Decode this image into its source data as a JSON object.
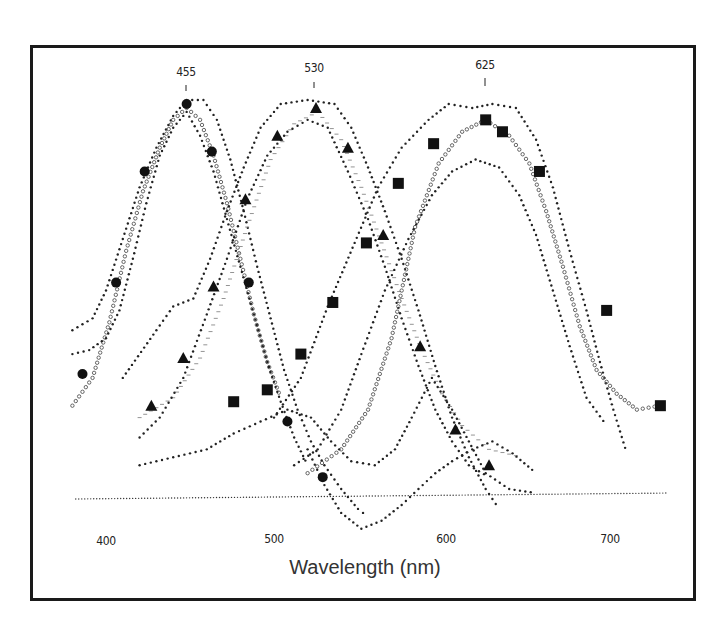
{
  "chart_data": {
    "type": "scatter",
    "title": "",
    "xlabel": "Wavelength (nm)",
    "ylabel": "",
    "xlim": [
      380,
      735
    ],
    "ylim": [
      -0.1,
      1.05
    ],
    "grid": false,
    "legend": null,
    "x_ticks": [
      400,
      500,
      600,
      700
    ],
    "peak_annotations": [
      {
        "label": "455",
        "x": 455
      },
      {
        "label": "530",
        "x": 530
      },
      {
        "label": "625",
        "x": 625
      }
    ],
    "series": [
      {
        "name": "blue cone (peak 455) – filled circles",
        "marker": "circle",
        "points": [
          [
            386,
            0.31
          ],
          [
            406,
            0.54
          ],
          [
            423,
            0.82
          ],
          [
            448,
            0.99
          ],
          [
            463,
            0.87
          ],
          [
            485,
            0.54
          ],
          [
            508,
            0.19
          ],
          [
            529,
            0.05
          ]
        ]
      },
      {
        "name": "green cone (peak 530) – triangles",
        "marker": "triangle",
        "points": [
          [
            427,
            0.23
          ],
          [
            446,
            0.35
          ],
          [
            464,
            0.53
          ],
          [
            483,
            0.75
          ],
          [
            502,
            0.91
          ],
          [
            525,
            0.98
          ],
          [
            544,
            0.88
          ],
          [
            565,
            0.66
          ],
          [
            587,
            0.38
          ],
          [
            608,
            0.17
          ],
          [
            628,
            0.08
          ]
        ]
      },
      {
        "name": "red cone (peak 625) – squares",
        "marker": "square",
        "points": [
          [
            476,
            0.24
          ],
          [
            496,
            0.27
          ],
          [
            516,
            0.36
          ],
          [
            535,
            0.49
          ],
          [
            555,
            0.64
          ],
          [
            574,
            0.79
          ],
          [
            595,
            0.89
          ],
          [
            626,
            0.95
          ],
          [
            636,
            0.92
          ],
          [
            658,
            0.82
          ],
          [
            698,
            0.47
          ],
          [
            730,
            0.23
          ]
        ]
      }
    ],
    "envelopes": [
      {
        "name": "blue upper",
        "style": "dot",
        "points": [
          [
            380,
            0.42
          ],
          [
            392,
            0.45
          ],
          [
            400,
            0.52
          ],
          [
            410,
            0.65
          ],
          [
            420,
            0.78
          ],
          [
            430,
            0.88
          ],
          [
            440,
            0.96
          ],
          [
            448,
            1.0
          ],
          [
            458,
            1.0
          ],
          [
            466,
            0.95
          ],
          [
            474,
            0.85
          ],
          [
            482,
            0.72
          ],
          [
            490,
            0.58
          ],
          [
            498,
            0.45
          ],
          [
            506,
            0.32
          ],
          [
            514,
            0.22
          ],
          [
            522,
            0.14
          ],
          [
            530,
            0.08
          ],
          [
            540,
            0.02
          ],
          [
            550,
            -0.03
          ],
          [
            556,
            -0.05
          ]
        ]
      },
      {
        "name": "blue mean (open circles)",
        "style": "ring",
        "points": [
          [
            380,
            0.23
          ],
          [
            392,
            0.3
          ],
          [
            402,
            0.44
          ],
          [
            412,
            0.62
          ],
          [
            422,
            0.77
          ],
          [
            432,
            0.88
          ],
          [
            440,
            0.95
          ],
          [
            448,
            0.98
          ],
          [
            456,
            0.95
          ],
          [
            464,
            0.86
          ],
          [
            472,
            0.74
          ],
          [
            480,
            0.6
          ],
          [
            488,
            0.46
          ],
          [
            496,
            0.34
          ],
          [
            504,
            0.25
          ]
        ]
      },
      {
        "name": "blue lower",
        "style": "dot",
        "points": [
          [
            380,
            0.36
          ],
          [
            390,
            0.37
          ],
          [
            400,
            0.4
          ],
          [
            408,
            0.47
          ],
          [
            416,
            0.6
          ],
          [
            424,
            0.74
          ],
          [
            432,
            0.86
          ],
          [
            440,
            0.93
          ],
          [
            448,
            0.97
          ],
          [
            456,
            0.91
          ],
          [
            464,
            0.82
          ],
          [
            472,
            0.7
          ],
          [
            480,
            0.58
          ],
          [
            488,
            0.46
          ],
          [
            496,
            0.34
          ],
          [
            504,
            0.24
          ],
          [
            512,
            0.15
          ],
          [
            520,
            0.08
          ]
        ]
      },
      {
        "name": "green upper",
        "style": "dot",
        "points": [
          [
            410,
            0.3
          ],
          [
            430,
            0.42
          ],
          [
            440,
            0.48
          ],
          [
            452,
            0.5
          ],
          [
            462,
            0.6
          ],
          [
            472,
            0.72
          ],
          [
            482,
            0.83
          ],
          [
            492,
            0.93
          ],
          [
            504,
            0.99
          ],
          [
            520,
            1.0
          ],
          [
            536,
            0.99
          ],
          [
            546,
            0.93
          ],
          [
            556,
            0.83
          ],
          [
            566,
            0.72
          ],
          [
            576,
            0.6
          ],
          [
            586,
            0.47
          ],
          [
            596,
            0.33
          ],
          [
            606,
            0.2
          ],
          [
            616,
            0.1
          ],
          [
            626,
            0.02
          ],
          [
            634,
            -0.03
          ]
        ]
      },
      {
        "name": "green mean (dashes)",
        "style": "dash",
        "points": [
          [
            420,
            0.2
          ],
          [
            440,
            0.25
          ],
          [
            456,
            0.35
          ],
          [
            470,
            0.5
          ],
          [
            484,
            0.68
          ],
          [
            498,
            0.85
          ],
          [
            512,
            0.94
          ],
          [
            526,
            0.97
          ],
          [
            540,
            0.9
          ],
          [
            552,
            0.78
          ],
          [
            564,
            0.64
          ],
          [
            576,
            0.5
          ],
          [
            588,
            0.37
          ],
          [
            600,
            0.26
          ],
          [
            612,
            0.18
          ],
          [
            628,
            0.12
          ],
          [
            648,
            0.1
          ]
        ]
      },
      {
        "name": "green lower",
        "style": "dot",
        "points": [
          [
            420,
            0.15
          ],
          [
            432,
            0.2
          ],
          [
            446,
            0.3
          ],
          [
            460,
            0.46
          ],
          [
            472,
            0.6
          ],
          [
            484,
            0.75
          ],
          [
            496,
            0.86
          ],
          [
            508,
            0.92
          ],
          [
            520,
            0.95
          ],
          [
            532,
            0.93
          ],
          [
            544,
            0.82
          ],
          [
            556,
            0.7
          ],
          [
            566,
            0.58
          ],
          [
            576,
            0.45
          ],
          [
            586,
            0.33
          ],
          [
            596,
            0.22
          ],
          [
            606,
            0.14
          ],
          [
            616,
            0.08
          ],
          [
            628,
            0.05
          ]
        ]
      },
      {
        "name": "red upper",
        "style": "dot",
        "points": [
          [
            500,
            0.2
          ],
          [
            516,
            0.3
          ],
          [
            532,
            0.48
          ],
          [
            548,
            0.64
          ],
          [
            562,
            0.78
          ],
          [
            576,
            0.88
          ],
          [
            592,
            0.95
          ],
          [
            604,
            0.99
          ],
          [
            618,
            0.98
          ],
          [
            630,
            0.99
          ],
          [
            644,
            0.98
          ],
          [
            656,
            0.9
          ],
          [
            666,
            0.78
          ],
          [
            676,
            0.62
          ],
          [
            686,
            0.47
          ],
          [
            694,
            0.34
          ],
          [
            702,
            0.22
          ],
          [
            710,
            0.11
          ]
        ]
      },
      {
        "name": "red mean (open circles)",
        "style": "ring",
        "points": [
          [
            520,
            0.06
          ],
          [
            540,
            0.12
          ],
          [
            556,
            0.22
          ],
          [
            570,
            0.4
          ],
          [
            584,
            0.68
          ],
          [
            598,
            0.84
          ],
          [
            612,
            0.92
          ],
          [
            626,
            0.95
          ],
          [
            640,
            0.91
          ],
          [
            652,
            0.84
          ],
          [
            662,
            0.72
          ],
          [
            672,
            0.58
          ],
          [
            682,
            0.43
          ],
          [
            692,
            0.32
          ],
          [
            704,
            0.26
          ],
          [
            716,
            0.22
          ],
          [
            730,
            0.23
          ]
        ]
      },
      {
        "name": "red lower",
        "style": "dot",
        "points": [
          [
            512,
            0.08
          ],
          [
            526,
            0.12
          ],
          [
            540,
            0.22
          ],
          [
            552,
            0.36
          ],
          [
            566,
            0.52
          ],
          [
            580,
            0.65
          ],
          [
            594,
            0.76
          ],
          [
            606,
            0.82
          ],
          [
            620,
            0.85
          ],
          [
            634,
            0.83
          ],
          [
            646,
            0.76
          ],
          [
            656,
            0.66
          ],
          [
            666,
            0.52
          ],
          [
            676,
            0.38
          ],
          [
            686,
            0.25
          ],
          [
            698,
            0.18
          ]
        ]
      },
      {
        "name": "long-wave tail 1",
        "style": "dot",
        "points": [
          [
            420,
            0.08
          ],
          [
            440,
            0.1
          ],
          [
            460,
            0.12
          ],
          [
            476,
            0.16
          ],
          [
            492,
            0.19
          ],
          [
            508,
            0.22
          ],
          [
            522,
            0.2
          ],
          [
            534,
            0.14
          ],
          [
            546,
            0.09
          ],
          [
            560,
            0.08
          ],
          [
            572,
            0.12
          ],
          [
            582,
            0.2
          ],
          [
            594,
            0.3
          ],
          [
            606,
            0.22
          ],
          [
            616,
            0.14
          ],
          [
            626,
            0.06
          ],
          [
            640,
            0.02
          ],
          [
            656,
            0.01
          ]
        ]
      },
      {
        "name": "long-wave tail 2",
        "style": "dot",
        "points": [
          [
            520,
            0.12
          ],
          [
            530,
            0.03
          ],
          [
            540,
            -0.04
          ],
          [
            552,
            -0.08
          ],
          [
            564,
            -0.06
          ],
          [
            576,
            -0.02
          ],
          [
            586,
            0.02
          ],
          [
            596,
            0.06
          ],
          [
            606,
            0.09
          ],
          [
            618,
            0.12
          ],
          [
            630,
            0.14
          ],
          [
            642,
            0.11
          ],
          [
            656,
            0.06
          ]
        ]
      },
      {
        "name": "baseline",
        "style": "fine",
        "points": [
          [
            382,
            -0.005
          ],
          [
            735,
            0.01
          ]
        ]
      }
    ]
  }
}
